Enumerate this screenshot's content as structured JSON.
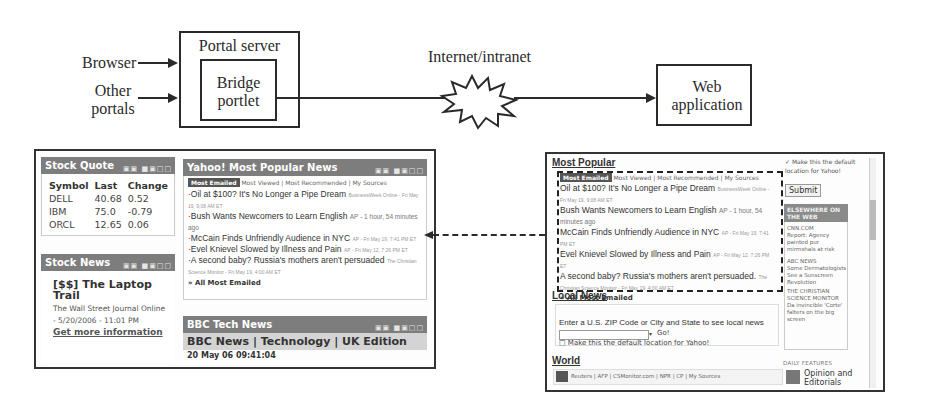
{
  "diagram": {
    "inputs": [
      "Browser",
      "Other portals"
    ],
    "portal_server": "Portal server",
    "bridge_portlet": "Bridge portlet",
    "network": "Internet/intranet",
    "web_app": "Web application"
  },
  "left_portal": {
    "stock_quote": {
      "title": "Stock Quote",
      "controls": "▣▣ ■▣□□",
      "columns": [
        "Symbol",
        "Last",
        "Change"
      ],
      "rows": [
        [
          "DELL",
          "40.68",
          "0.52"
        ],
        [
          "IBM",
          "75.0",
          "-0.79"
        ],
        [
          "ORCL",
          "12.65",
          "0.06"
        ]
      ]
    },
    "stock_news": {
      "title": "Stock News",
      "controls": "▣▣ ■▣□□",
      "headline": "[$$] The Laptop Trail",
      "source": "The Wall Street Journal Online - 5/20/2006 - 11:01 PM",
      "link": "Get more information"
    },
    "yahoo_news": {
      "title": "Yahoo! Most Popular News",
      "controls": "▣▣ ■▣□□",
      "tabs": [
        "Most Emailed",
        "Most Viewed",
        "Most Recommended",
        "My Sources"
      ],
      "items": [
        {
          "headline": "Oil at $100? It's No Longer a Pipe Dream",
          "meta": "BusinessWeek Online - Fri May 19, 9:08 AM ET"
        },
        {
          "headline": "Bush Wants Newcomers to Learn English",
          "meta": "AP - 1 hour, 54 minutes ago"
        },
        {
          "headline": "McCain Finds Unfriendly Audience in NYC",
          "meta": "AP - Fri May 19, 7:41 PM ET"
        },
        {
          "headline": "Evel Knievel Slowed by Illness and Pain",
          "meta": "AP - Fri May 12, 7:26 PM ET"
        },
        {
          "headline": "A second baby? Russia's mothers aren't persuaded",
          "meta": "The Christian Science Monitor - Fri May 19, 4:00 AM ET"
        }
      ],
      "more_link": "» All Most Emailed"
    },
    "bbc": {
      "title": "BBC Tech News",
      "controls": "▣▣ ■▣□□",
      "subtitle": "BBC News | Technology | UK Edition",
      "timestamp": "20 May 06 09:41:04"
    }
  },
  "right_page": {
    "most_popular": {
      "title": "Most Popular",
      "tabs": [
        "Most Emailed",
        "Most Viewed",
        "Most Recommended",
        "My Sources"
      ],
      "items": [
        {
          "headline": "Oil at $100? It's No Longer a Pipe Dream",
          "meta": "BusinessWeek Online - Fri May 19, 9:08 AM ET"
        },
        {
          "headline": "Bush Wants Newcomers to Learn English",
          "meta": "AP - 1 hour, 54 minutes ago"
        },
        {
          "headline": "McCain Finds Unfriendly Audience in NYC",
          "meta": "AP - Fri May 19, 7:41 PM ET"
        },
        {
          "headline": "Evel Knievel Slowed by Illness and Pain",
          "meta": "AP - Fri May 12, 7:26 PM ET"
        },
        {
          "headline": "A second baby? Russia's mothers aren't persuaded.",
          "meta": "The Christian Science Monitor - Fri May 19, 4:00 AM ET"
        }
      ],
      "more_link": "» All Most Emailed"
    },
    "local_news": {
      "title": "Local News",
      "prompt": "Enter a U.S. ZIP Code or City and State to see local news",
      "input_value": "",
      "go_label": "Go!",
      "default_label": "Make this the default location for Yahoo!"
    },
    "world": {
      "title": "World",
      "tabs": "Reuters | AFP | CSMonitor.com | NPR | CP | My Sources"
    },
    "sidebar": {
      "default_label": "Make this the default location for Yahoo!",
      "submit_label": "Submit",
      "elsewhere_title": "ELSEWHERE ON THE WEB",
      "items": [
        {
          "source": "CNN.COM",
          "text": "Report: Agency painted pur mirmshals at risk"
        },
        {
          "source": "ABC NEWS",
          "text": "Some Dermatologists See a Sunscreen Revolution"
        },
        {
          "source": "THE CHRISTIAN SCIENCE MONITOR",
          "text": "Da invincible 'Corte' falters on the big screen"
        }
      ],
      "daily_features": "DAILY FEATURES",
      "feature_link": "Opinion and Editorials"
    }
  }
}
